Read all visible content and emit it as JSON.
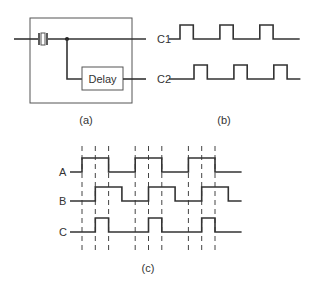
{
  "figure": {
    "circuit": {
      "delay_label": "Delay",
      "outputs": [
        "C1",
        "C2"
      ],
      "caption": "(a)"
    },
    "clock_waveforms": {
      "caption": "(b)",
      "signals": [
        {
          "name": "C1",
          "pulses": [
            [
              0,
              1
            ],
            [
              3,
              4
            ],
            [
              6,
              7
            ]
          ],
          "end": 9
        },
        {
          "name": "C2",
          "pulses": [
            [
              1,
              2
            ],
            [
              4,
              5
            ],
            [
              7,
              8
            ]
          ],
          "end": 9
        }
      ]
    },
    "timing_diagram": {
      "caption": "(c)",
      "signals": [
        {
          "name": "A",
          "pulses": [
            [
              0,
              2
            ],
            [
              4,
              6
            ],
            [
              8,
              10
            ]
          ],
          "end": 12
        },
        {
          "name": "B",
          "pulses": [
            [
              1,
              3
            ],
            [
              5,
              7
            ],
            [
              9,
              11
            ]
          ],
          "end": 12
        },
        {
          "name": "C",
          "pulses": [
            [
              1,
              2
            ],
            [
              5,
              6
            ],
            [
              9,
              10
            ]
          ],
          "end": 12
        }
      ],
      "dashed_marks": [
        0,
        1,
        2,
        4,
        5,
        6,
        8,
        9,
        10
      ]
    }
  }
}
